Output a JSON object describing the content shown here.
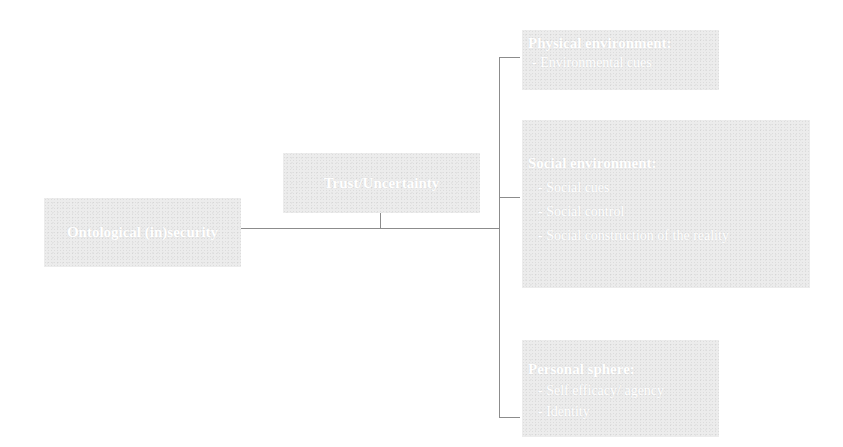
{
  "diagram": {
    "root": {
      "label": "Ontological (in)security"
    },
    "mediator": {
      "label": "Trust/Uncertainty"
    },
    "branches": [
      {
        "title": "Physical environment:",
        "items": [
          "- Environmental cues"
        ]
      },
      {
        "title": "Social environment:",
        "items": [
          "- Social cues",
          "- Social control",
          "- Social construction of the reality"
        ]
      },
      {
        "title": "Personal sphere:",
        "items": [
          "- Self efficacy/ agency",
          "- Identity"
        ]
      }
    ]
  },
  "colors": {
    "box_fill": "#ececec",
    "text": "#ffffff",
    "connector": "#8c8c8c"
  }
}
